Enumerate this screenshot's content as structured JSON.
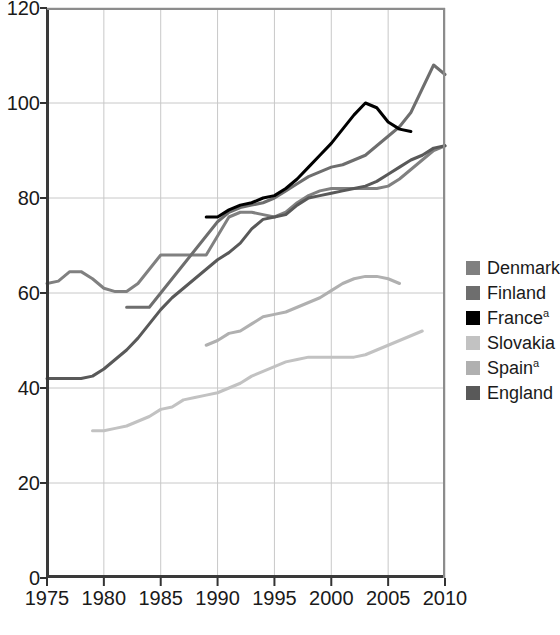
{
  "chart_data": {
    "type": "line",
    "title": "",
    "xlabel": "",
    "ylabel": "",
    "xlim": [
      1975,
      2010
    ],
    "ylim": [
      0,
      120
    ],
    "xticks": [
      1975,
      1980,
      1985,
      1990,
      1995,
      2000,
      2005,
      2010
    ],
    "yticks": [
      0,
      20,
      40,
      60,
      80,
      100,
      120
    ],
    "grid": true,
    "legend_position": "right",
    "series": [
      {
        "name": "Denmark",
        "label": "Denmark",
        "color": "#808080",
        "x": [
          1975,
          1976,
          1977,
          1978,
          1979,
          1980,
          1981,
          1982,
          1983,
          1984,
          1985,
          1986,
          1987,
          1988,
          1989,
          1990,
          1991,
          1992,
          1993,
          1994,
          1995,
          1996,
          1997,
          1998,
          1999,
          2000,
          2001,
          2002,
          2003,
          2004,
          2005,
          2006,
          2007,
          2008,
          2009,
          2010
        ],
        "y": [
          62,
          62.5,
          64.5,
          64.5,
          63,
          61,
          60.3,
          60.3,
          62,
          65,
          68,
          68,
          68,
          68,
          68,
          72,
          76,
          77,
          77,
          76.5,
          76,
          77,
          79,
          80.5,
          81.5,
          82,
          82,
          82,
          82,
          82,
          82.5,
          84,
          86,
          88,
          90,
          91
        ]
      },
      {
        "name": "Finland",
        "label": "Finland",
        "color": "#6e6e6e",
        "x": [
          1982,
          1983,
          1984,
          1985,
          1986,
          1987,
          1988,
          1989,
          1990,
          1991,
          1992,
          1993,
          1994,
          1995,
          1996,
          1997,
          1998,
          1999,
          2000,
          2001,
          2002,
          2003,
          2004,
          2005,
          2006,
          2007,
          2008,
          2009,
          2010
        ],
        "y": [
          57,
          57,
          57,
          60,
          63,
          66,
          69,
          72,
          75,
          77,
          78,
          78.5,
          79,
          80,
          81.5,
          83,
          84.5,
          85.5,
          86.5,
          87,
          88,
          89,
          91,
          93,
          95,
          98,
          103,
          108,
          106
        ]
      },
      {
        "name": "France",
        "label": "France",
        "superscript": "a",
        "color": "#000000",
        "x": [
          1989,
          1990,
          1991,
          1992,
          1993,
          1994,
          1995,
          1996,
          1997,
          1998,
          1999,
          2000,
          2001,
          2002,
          2003,
          2004,
          2005,
          2006,
          2007
        ],
        "y": [
          76,
          76,
          77.5,
          78.5,
          79,
          80,
          80.5,
          82,
          84,
          86.5,
          89,
          91.5,
          94.5,
          97.5,
          100,
          99,
          96,
          94.5,
          94
        ]
      },
      {
        "name": "Slovakia",
        "label": "Slovakia",
        "color": "#c2c2c2",
        "x": [
          1979,
          1980,
          1981,
          1982,
          1983,
          1984,
          1985,
          1986,
          1987,
          1988,
          1989,
          1990,
          1991,
          1992,
          1993,
          1994,
          1995,
          1996,
          1997,
          1998,
          1999,
          2000,
          2001,
          2002,
          2003,
          2004,
          2005,
          2006,
          2007,
          2008
        ],
        "y": [
          31,
          31,
          31.5,
          32,
          33,
          34,
          35.5,
          36,
          37.5,
          38,
          38.5,
          39,
          40,
          41,
          42.5,
          43.5,
          44.5,
          45.5,
          46,
          46.5,
          46.5,
          46.5,
          46.5,
          46.5,
          47,
          48,
          49,
          50,
          51,
          52
        ]
      },
      {
        "name": "Spain",
        "label": "Spain",
        "superscript": "a",
        "color": "#b0b0b0",
        "x": [
          1989,
          1990,
          1991,
          1992,
          1993,
          1994,
          1995,
          1996,
          1997,
          1998,
          1999,
          2000,
          2001,
          2002,
          2003,
          2004,
          2005,
          2006
        ],
        "y": [
          49,
          50,
          51.5,
          52,
          53.5,
          55,
          55.5,
          56,
          57,
          58,
          59,
          60.5,
          62,
          63,
          63.5,
          63.5,
          63,
          62
        ]
      },
      {
        "name": "England",
        "label": "England",
        "color": "#595959",
        "x": [
          1975,
          1976,
          1977,
          1978,
          1979,
          1980,
          1981,
          1982,
          1983,
          1984,
          1985,
          1986,
          1987,
          1988,
          1989,
          1990,
          1991,
          1992,
          1993,
          1994,
          1995,
          1996,
          1997,
          1998,
          1999,
          2000,
          2001,
          2002,
          2003,
          2004,
          2005,
          2006,
          2007,
          2008,
          2009,
          2010
        ],
        "y": [
          42,
          42,
          42,
          42,
          42.5,
          44,
          46,
          48,
          50.5,
          53.5,
          56.5,
          59,
          61,
          63,
          65,
          67,
          68.5,
          70.5,
          73.5,
          75.5,
          76,
          76.5,
          78.5,
          80,
          80.5,
          81,
          81.5,
          82,
          82.5,
          83.5,
          85,
          86.5,
          88,
          89,
          90.5,
          91
        ]
      }
    ]
  },
  "axes": {
    "tick_color": "#333333",
    "grid_color": "#c8c8c8",
    "frame_color": "#3a3a3a"
  }
}
